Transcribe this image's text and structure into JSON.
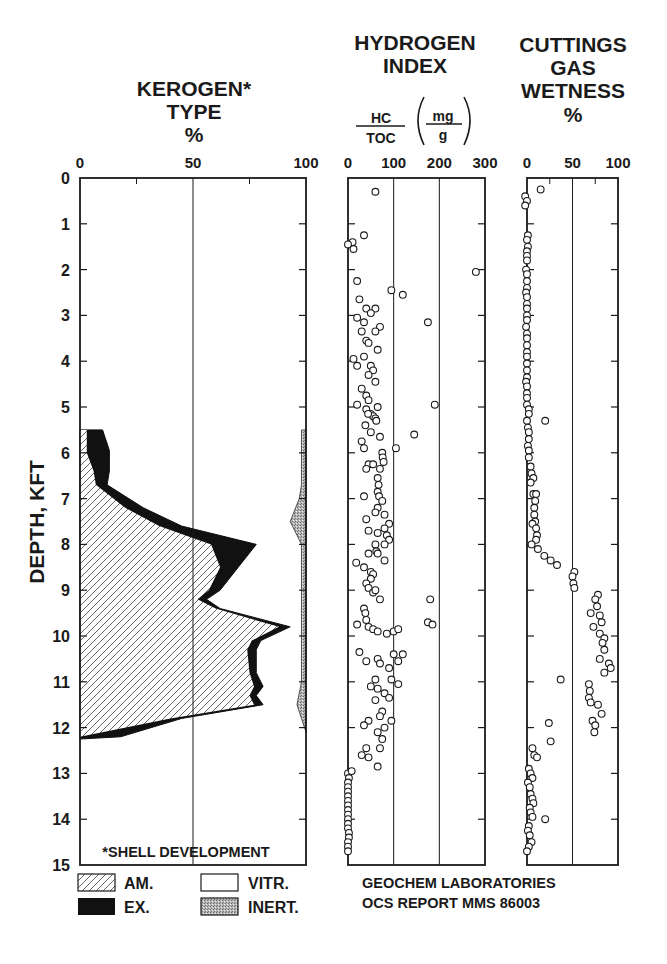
{
  "chart_data": [
    {
      "type": "area",
      "title": "KEROGEN* TYPE %",
      "title_lines": [
        "KEROGEN*",
        "TYPE",
        "%"
      ],
      "xlabel": "%",
      "ylabel": "DEPTH, KFT",
      "xlim": [
        0,
        100
      ],
      "ylim": [
        15,
        0
      ],
      "x_ticks": [
        "0",
        "50",
        "100"
      ],
      "y_ticks": [
        "0",
        "1",
        "2",
        "3",
        "4",
        "5",
        "6",
        "7",
        "8",
        "9",
        "10",
        "11",
        "12",
        "13",
        "14",
        "15"
      ],
      "annotation": "*SHELL DEVELOPMENT",
      "legend": [
        {
          "label": "AM.",
          "pattern": "hatch"
        },
        {
          "label": "EX.",
          "pattern": "solid-black"
        },
        {
          "label": "VITR.",
          "pattern": "white"
        },
        {
          "label": "INERT.",
          "pattern": "stipple-gray"
        }
      ],
      "series": [
        {
          "name": "AM. (cumulative boundary %)",
          "depth": [
            5.5,
            6.0,
            6.4,
            6.7,
            7.2,
            7.6,
            8.0,
            8.5,
            9.0,
            9.2,
            9.4,
            9.8,
            10.1,
            10.3,
            10.8,
            11.1,
            11.3,
            11.5,
            11.8,
            12.2
          ],
          "values": [
            3,
            3,
            6,
            7,
            20,
            35,
            58,
            62,
            57,
            52,
            60,
            88,
            76,
            74,
            75,
            77,
            75,
            77,
            40,
            0
          ]
        },
        {
          "name": "AM.+EX. (cumulative boundary %)",
          "depth": [
            5.5,
            5.95,
            6.4,
            6.7,
            7.2,
            7.6,
            8.0,
            8.5,
            9.0,
            9.2,
            9.4,
            9.8,
            10.1,
            10.3,
            10.8,
            11.1,
            11.3,
            11.5,
            11.8,
            12.2,
            12.25
          ],
          "values": [
            10,
            13,
            13,
            12,
            28,
            45,
            78,
            70,
            62,
            56,
            62,
            93,
            80,
            78,
            78,
            81,
            78,
            81,
            45,
            18,
            0
          ]
        },
        {
          "name": "INERT. (left boundary %, right edge 100)",
          "depth": [
            5.5,
            6.7,
            7.0,
            7.5,
            8.0,
            9.0,
            10.0,
            11.0,
            11.5,
            12.1
          ],
          "values": [
            98,
            98,
            97,
            93,
            98,
            98,
            98,
            98,
            96,
            100
          ]
        }
      ]
    },
    {
      "type": "scatter",
      "title": "HYDROGEN INDEX",
      "title_lines": [
        "HYDROGEN",
        "INDEX"
      ],
      "units": {
        "num": "HC",
        "den": "TOC",
        "unit_num": "mg",
        "unit_den": "g"
      },
      "xlim": [
        0,
        300
      ],
      "ylim": [
        15,
        0
      ],
      "x_ticks": [
        "0",
        "100",
        "200",
        "300"
      ],
      "points": [
        [
          60,
          0.3
        ],
        [
          35,
          1.25
        ],
        [
          10,
          1.4
        ],
        [
          0,
          1.45
        ],
        [
          12,
          1.55
        ],
        [
          280,
          2.05
        ],
        [
          20,
          2.25
        ],
        [
          95,
          2.45
        ],
        [
          120,
          2.55
        ],
        [
          25,
          2.65
        ],
        [
          40,
          2.85
        ],
        [
          60,
          2.85
        ],
        [
          50,
          2.95
        ],
        [
          20,
          3.05
        ],
        [
          35,
          3.15
        ],
        [
          70,
          3.25
        ],
        [
          175,
          3.15
        ],
        [
          60,
          3.35
        ],
        [
          30,
          3.35
        ],
        [
          40,
          3.55
        ],
        [
          45,
          3.6
        ],
        [
          65,
          3.75
        ],
        [
          12,
          3.95
        ],
        [
          35,
          3.9
        ],
        [
          20,
          4.1
        ],
        [
          50,
          4.1
        ],
        [
          55,
          4.2
        ],
        [
          45,
          4.3
        ],
        [
          60,
          4.45
        ],
        [
          30,
          4.6
        ],
        [
          40,
          4.75
        ],
        [
          45,
          4.85
        ],
        [
          20,
          4.95
        ],
        [
          190,
          4.95
        ],
        [
          50,
          5.15
        ],
        [
          55,
          5.2
        ],
        [
          40,
          5.05
        ],
        [
          65,
          5.0
        ],
        [
          38,
          5.4
        ],
        [
          44,
          5.15
        ],
        [
          60,
          5.25
        ],
        [
          62,
          5.3
        ],
        [
          50,
          5.55
        ],
        [
          145,
          5.6
        ],
        [
          70,
          5.65
        ],
        [
          30,
          5.75
        ],
        [
          35,
          5.9
        ],
        [
          105,
          5.9
        ],
        [
          75,
          6.0
        ],
        [
          76,
          6.1
        ],
        [
          78,
          6.2
        ],
        [
          45,
          6.25
        ],
        [
          55,
          6.25
        ],
        [
          40,
          6.35
        ],
        [
          70,
          6.35
        ],
        [
          65,
          6.55
        ],
        [
          67,
          6.7
        ],
        [
          65,
          6.85
        ],
        [
          68,
          6.95
        ],
        [
          35,
          6.95
        ],
        [
          75,
          7.05
        ],
        [
          65,
          7.2
        ],
        [
          60,
          7.3
        ],
        [
          80,
          7.35
        ],
        [
          90,
          7.55
        ],
        [
          40,
          7.45
        ],
        [
          45,
          7.7
        ],
        [
          65,
          7.75
        ],
        [
          80,
          7.65
        ],
        [
          85,
          7.8
        ],
        [
          90,
          7.9
        ],
        [
          80,
          8.0
        ],
        [
          60,
          8.0
        ],
        [
          62,
          8.15
        ],
        [
          45,
          8.2
        ],
        [
          65,
          8.2
        ],
        [
          80,
          8.35
        ],
        [
          18,
          8.4
        ],
        [
          35,
          8.5
        ],
        [
          50,
          8.6
        ],
        [
          55,
          8.65
        ],
        [
          50,
          8.75
        ],
        [
          40,
          8.85
        ],
        [
          45,
          8.95
        ],
        [
          55,
          9.05
        ],
        [
          60,
          9.0
        ],
        [
          70,
          9.2
        ],
        [
          35,
          9.4
        ],
        [
          38,
          9.5
        ],
        [
          40,
          9.65
        ],
        [
          180,
          9.2
        ],
        [
          175,
          9.7
        ],
        [
          185,
          9.75
        ],
        [
          20,
          9.75
        ],
        [
          45,
          9.8
        ],
        [
          55,
          9.85
        ],
        [
          65,
          9.9
        ],
        [
          85,
          9.95
        ],
        [
          100,
          9.9
        ],
        [
          110,
          9.85
        ],
        [
          25,
          10.35
        ],
        [
          40,
          10.55
        ],
        [
          65,
          10.5
        ],
        [
          70,
          10.6
        ],
        [
          90,
          10.7
        ],
        [
          110,
          10.55
        ],
        [
          100,
          10.4
        ],
        [
          120,
          10.4
        ],
        [
          60,
          10.95
        ],
        [
          95,
          10.95
        ],
        [
          110,
          11.05
        ],
        [
          50,
          11.1
        ],
        [
          65,
          11.15
        ],
        [
          80,
          11.25
        ],
        [
          90,
          11.35
        ],
        [
          60,
          11.4
        ],
        [
          75,
          11.65
        ],
        [
          70,
          11.75
        ],
        [
          45,
          11.85
        ],
        [
          95,
          11.85
        ],
        [
          35,
          11.95
        ],
        [
          80,
          12.0
        ],
        [
          65,
          12.1
        ],
        [
          75,
          12.25
        ],
        [
          40,
          12.45
        ],
        [
          70,
          12.45
        ],
        [
          30,
          12.6
        ],
        [
          45,
          12.65
        ],
        [
          65,
          12.85
        ],
        [
          0,
          13.0
        ],
        [
          8,
          12.95
        ],
        [
          2,
          13.1
        ],
        [
          0,
          13.2
        ],
        [
          0,
          13.3
        ],
        [
          0,
          13.4
        ],
        [
          0,
          13.5
        ],
        [
          0,
          13.6
        ],
        [
          0,
          13.7
        ],
        [
          0,
          13.8
        ],
        [
          0,
          13.9
        ],
        [
          0,
          14.0
        ],
        [
          0,
          14.1
        ],
        [
          0,
          14.2
        ],
        [
          2,
          14.3
        ],
        [
          2,
          14.4
        ],
        [
          0,
          14.5
        ],
        [
          0,
          14.6
        ],
        [
          0,
          14.7
        ]
      ]
    },
    {
      "type": "scatter",
      "title": "CUTTINGS GAS WETNESS %",
      "title_lines": [
        "CUTTINGS",
        "GAS",
        "WETNESS",
        "%"
      ],
      "xlim": [
        0,
        100
      ],
      "ylim": [
        15,
        0
      ],
      "x_ticks": [
        "0",
        "50",
        "100"
      ],
      "points": [
        [
          15,
          0.25
        ],
        [
          -2,
          0.4
        ],
        [
          0,
          0.5
        ],
        [
          -2,
          0.6
        ],
        [
          1,
          1.25
        ],
        [
          0,
          1.35
        ],
        [
          1,
          1.5
        ],
        [
          0,
          1.6
        ],
        [
          0,
          1.7
        ],
        [
          0,
          1.8
        ],
        [
          -1,
          2.0
        ],
        [
          0,
          2.1
        ],
        [
          0,
          2.25
        ],
        [
          0,
          2.4
        ],
        [
          -1,
          2.5
        ],
        [
          0,
          2.6
        ],
        [
          0,
          2.75
        ],
        [
          0,
          2.85
        ],
        [
          0,
          3.0
        ],
        [
          0,
          3.1
        ],
        [
          -1,
          3.25
        ],
        [
          0,
          3.4
        ],
        [
          0,
          3.5
        ],
        [
          0,
          3.65
        ],
        [
          0,
          3.8
        ],
        [
          0,
          3.9
        ],
        [
          0,
          4.05
        ],
        [
          0,
          4.2
        ],
        [
          0,
          4.35
        ],
        [
          -1,
          4.45
        ],
        [
          0,
          4.55
        ],
        [
          0,
          4.7
        ],
        [
          0,
          4.8
        ],
        [
          0,
          4.95
        ],
        [
          2,
          5.05
        ],
        [
          2,
          5.15
        ],
        [
          0,
          5.3
        ],
        [
          20,
          5.3
        ],
        [
          1,
          5.45
        ],
        [
          2,
          5.55
        ],
        [
          2,
          5.7
        ],
        [
          1,
          5.85
        ],
        [
          2,
          5.95
        ],
        [
          2,
          6.1
        ],
        [
          4,
          6.3
        ],
        [
          5,
          6.45
        ],
        [
          7,
          6.55
        ],
        [
          4,
          6.65
        ],
        [
          7,
          6.9
        ],
        [
          10,
          6.9
        ],
        [
          9,
          7.05
        ],
        [
          8,
          7.2
        ],
        [
          8,
          7.35
        ],
        [
          9,
          7.5
        ],
        [
          6,
          7.55
        ],
        [
          10,
          7.65
        ],
        [
          11,
          7.8
        ],
        [
          10,
          7.9
        ],
        [
          5,
          8.0
        ],
        [
          12,
          8.1
        ],
        [
          19,
          8.25
        ],
        [
          26,
          8.35
        ],
        [
          33,
          8.45
        ],
        [
          52,
          8.6
        ],
        [
          50,
          8.7
        ],
        [
          51,
          8.85
        ],
        [
          52,
          8.95
        ],
        [
          78,
          9.1
        ],
        [
          75,
          9.2
        ],
        [
          77,
          9.35
        ],
        [
          70,
          9.5
        ],
        [
          80,
          9.55
        ],
        [
          82,
          9.7
        ],
        [
          73,
          9.8
        ],
        [
          80,
          9.95
        ],
        [
          85,
          10.05
        ],
        [
          83,
          10.15
        ],
        [
          85,
          10.3
        ],
        [
          80,
          10.5
        ],
        [
          90,
          10.6
        ],
        [
          92,
          10.7
        ],
        [
          85,
          10.8
        ],
        [
          37,
          10.95
        ],
        [
          68,
          11.05
        ],
        [
          69,
          11.2
        ],
        [
          68,
          11.35
        ],
        [
          70,
          11.45
        ],
        [
          78,
          11.5
        ],
        [
          82,
          11.7
        ],
        [
          72,
          11.85
        ],
        [
          75,
          11.95
        ],
        [
          74,
          12.1
        ],
        [
          24,
          11.9
        ],
        [
          26,
          12.3
        ],
        [
          6,
          12.45
        ],
        [
          8,
          12.6
        ],
        [
          11,
          12.65
        ],
        [
          2,
          12.9
        ],
        [
          4,
          13.0
        ],
        [
          6,
          13.1
        ],
        [
          1,
          13.2
        ],
        [
          3,
          13.3
        ],
        [
          4,
          13.45
        ],
        [
          6,
          13.55
        ],
        [
          7,
          13.65
        ],
        [
          3,
          13.75
        ],
        [
          4,
          13.85
        ],
        [
          6,
          13.95
        ],
        [
          20,
          14.0
        ],
        [
          2,
          14.15
        ],
        [
          1,
          14.25
        ],
        [
          3,
          14.35
        ],
        [
          5,
          14.5
        ],
        [
          2,
          14.6
        ],
        [
          0,
          14.7
        ]
      ]
    }
  ],
  "labels": {
    "kerogen_title": [
      "KEROGEN*",
      "TYPE",
      "%"
    ],
    "hi_title": [
      "HYDROGEN",
      "INDEX"
    ],
    "hi_num": "HC",
    "hi_den": "TOC",
    "hi_unit_num": "mg",
    "hi_unit_den": "g",
    "gw_title": [
      "CUTTINGS",
      "GAS",
      "WETNESS",
      "%"
    ],
    "ylabel": "DEPTH, KFT",
    "annotation": "*SHELL DEVELOPMENT",
    "legend": [
      "AM.",
      "EX.",
      "VITR.",
      "INERT."
    ],
    "footer": [
      "GEOCHEM LABORATORIES",
      "OCS REPORT MMS 86003"
    ]
  }
}
